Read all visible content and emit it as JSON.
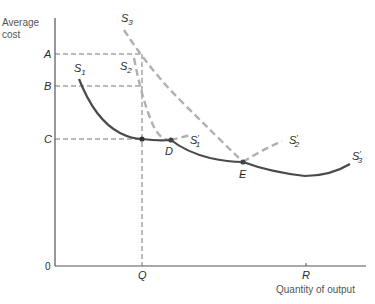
{
  "diagram": {
    "title_fragment": "",
    "y_axis_label_line1": "Average",
    "y_axis_label_line2": "cost",
    "x_axis_label": "Quantity of output",
    "origin_label": "0",
    "y_ticks": {
      "A": "A",
      "B": "B",
      "C": "C"
    },
    "x_ticks": {
      "Q": "Q",
      "R": "R"
    },
    "points": {
      "D": "D",
      "E": "E"
    },
    "curves": {
      "s1": {
        "name": "S",
        "sub": "1",
        "prime_name": "S",
        "prime_sub": "1",
        "prime_mark": "′"
      },
      "s2": {
        "name": "S",
        "sub": "2",
        "prime_name": "S",
        "prime_sub": "2",
        "prime_mark": "′"
      },
      "s3": {
        "name": "S",
        "sub": "3",
        "prime_name": "S",
        "prime_sub": "3",
        "prime_mark": "′"
      }
    },
    "colors": {
      "solid_curve": "#4a4a4a",
      "dashed_curve": "#b0b0b0",
      "axis": "#555555",
      "guide": "#666666"
    }
  }
}
